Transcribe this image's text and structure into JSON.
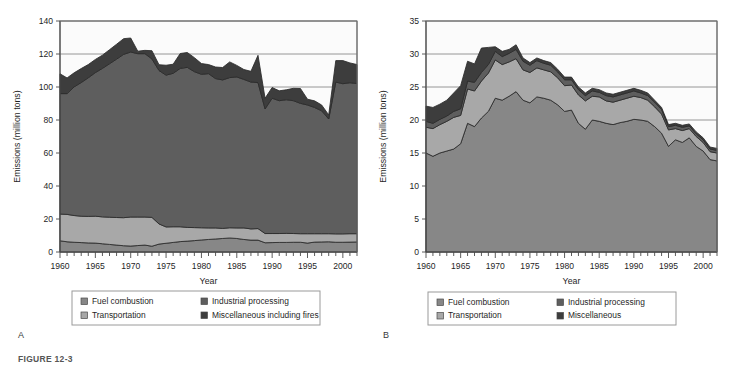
{
  "figure": {
    "caption": "FIGURE 12-3",
    "panel_a_letter": "A",
    "panel_b_letter": "B"
  },
  "colors": {
    "fuel_combustion": "#878787",
    "industrial_processing": "#5e5e5e",
    "transportation": "#a8a8a8",
    "miscellaneous": "#3d3d3d",
    "plot_background": "#fbfbfb",
    "gridline": "#8a8a8a",
    "axis": "#4a4a4a",
    "outline": "#2a2a2a"
  },
  "panel_a": {
    "letter": "A",
    "legend": {
      "items": [
        {
          "label": "Fuel combustion",
          "color_key": "fuel_combustion"
        },
        {
          "label": "Industrial processing",
          "color_key": "industrial_processing"
        },
        {
          "label": "Transportation",
          "color_key": "transportation"
        },
        {
          "label": "Miscellaneous including fires",
          "color_key": "miscellaneous"
        }
      ]
    },
    "chart_data": {
      "type": "area",
      "stacked": true,
      "title": "",
      "xlabel": "Year",
      "ylabel": "Emissions (million tons)",
      "xlim": [
        1960,
        2002
      ],
      "ylim": [
        0,
        140
      ],
      "yticks": [
        0,
        20,
        40,
        60,
        80,
        100,
        120,
        140
      ],
      "xticks": [
        1960,
        1965,
        1970,
        1975,
        1980,
        1985,
        1990,
        1995,
        2000
      ],
      "grid": "horizontal",
      "legend_position": "below",
      "x": [
        1960,
        1961,
        1962,
        1963,
        1964,
        1965,
        1966,
        1967,
        1968,
        1969,
        1970,
        1971,
        1972,
        1973,
        1974,
        1975,
        1976,
        1977,
        1978,
        1979,
        1980,
        1981,
        1982,
        1983,
        1984,
        1985,
        1986,
        1987,
        1988,
        1989,
        1990,
        1991,
        1992,
        1993,
        1994,
        1995,
        1996,
        1997,
        1998,
        1999,
        2000,
        2001,
        2002
      ],
      "series": [
        {
          "name": "Fuel combustion",
          "color_key": "fuel_combustion",
          "values": [
            6.8,
            6.2,
            5.9,
            5.7,
            5.5,
            5.4,
            5.0,
            4.6,
            4.2,
            3.8,
            3.6,
            3.9,
            4.2,
            3.5,
            4.8,
            5.3,
            5.8,
            6.3,
            6.6,
            6.9,
            7.3,
            7.6,
            7.9,
            8.2,
            8.5,
            8.2,
            7.6,
            7.2,
            7.2,
            5.6,
            5.7,
            5.8,
            5.8,
            5.9,
            5.9,
            5.4,
            6.0,
            6.1,
            6.2,
            5.9,
            5.9,
            6.0,
            6.1
          ]
        },
        {
          "name": "Transportation",
          "color_key": "transportation",
          "values": [
            16.2,
            16.6,
            16.2,
            16.0,
            16.1,
            16.3,
            16.3,
            16.5,
            16.7,
            17.0,
            17.6,
            17.3,
            17.0,
            17.5,
            12.2,
            9.9,
            9.5,
            9.0,
            8.3,
            7.9,
            7.4,
            7.0,
            6.7,
            6.1,
            6.2,
            6.4,
            7.0,
            6.8,
            7.0,
            5.6,
            5.5,
            5.4,
            5.5,
            5.3,
            5.2,
            5.7,
            5.1,
            5.0,
            4.9,
            5.1,
            5.1,
            5.1,
            5.0
          ]
        },
        {
          "name": "Industrial processing",
          "color_key": "industrial_processing",
          "values": [
            73.0,
            73.2,
            78.0,
            81.0,
            84.0,
            87.0,
            90.0,
            93.0,
            96.0,
            99.0,
            100.0,
            99.0,
            99.0,
            96.0,
            93.0,
            92.0,
            93.0,
            96.0,
            97.0,
            94.5,
            93.0,
            93.5,
            90.5,
            90.0,
            91.0,
            91.5,
            90.0,
            89.0,
            88.5,
            75.5,
            82.0,
            80.5,
            81.0,
            80.5,
            79.0,
            78.0,
            76.5,
            74.5,
            69.5,
            92.0,
            91.0,
            91.5,
            91.0
          ]
        },
        {
          "name": "Miscellaneous including fires",
          "color_key": "miscellaneous",
          "values": [
            12.0,
            9.5,
            8.5,
            8.5,
            8.0,
            8.0,
            8.0,
            8.5,
            9.0,
            9.5,
            8.5,
            1.5,
            2.0,
            5.0,
            3.5,
            6.0,
            5.5,
            9.0,
            9.0,
            8.5,
            6.5,
            5.5,
            7.0,
            7.5,
            9.5,
            7.0,
            6.0,
            6.5,
            16.5,
            6.5,
            6.5,
            6.0,
            6.0,
            7.5,
            9.0,
            3.5,
            4.0,
            3.5,
            2.5,
            13.0,
            14.0,
            12.0,
            11.5
          ]
        }
      ]
    }
  },
  "panel_b": {
    "letter": "B",
    "legend": {
      "items": [
        {
          "label": "Fuel combustion",
          "color_key": "fuel_combustion"
        },
        {
          "label": "Industrial processing",
          "color_key": "industrial_processing"
        },
        {
          "label": "Transportation",
          "color_key": "transportation"
        },
        {
          "label": "Miscellaneous",
          "color_key": "miscellaneous"
        }
      ]
    },
    "chart_data": {
      "type": "area",
      "stacked": true,
      "title": "",
      "xlabel": "Year",
      "ylabel": "Emissions (million tons)",
      "xlim": [
        1960,
        2002
      ],
      "ylim": [
        0,
        35
      ],
      "yticks": [
        0,
        5,
        10,
        15,
        20,
        25,
        30,
        35
      ],
      "xticks": [
        1960,
        1965,
        1970,
        1975,
        1980,
        1985,
        1990,
        1995,
        2000
      ],
      "grid": "horizontal",
      "legend_position": "below",
      "x": [
        1960,
        1961,
        1962,
        1963,
        1964,
        1965,
        1966,
        1967,
        1968,
        1969,
        1970,
        1971,
        1972,
        1973,
        1974,
        1975,
        1976,
        1977,
        1978,
        1979,
        1980,
        1981,
        1982,
        1983,
        1984,
        1985,
        1986,
        1987,
        1988,
        1989,
        1990,
        1991,
        1992,
        1993,
        1994,
        1995,
        1996,
        1997,
        1998,
        1999,
        2000,
        2001,
        2002
      ],
      "series": [
        {
          "name": "Fuel combustion",
          "color_key": "fuel_combustion",
          "values": [
            15.0,
            14.5,
            15.0,
            15.3,
            15.6,
            16.4,
            19.5,
            19.0,
            20.3,
            21.3,
            23.3,
            23.0,
            23.6,
            24.3,
            23.0,
            22.6,
            23.5,
            23.3,
            23.0,
            22.3,
            21.3,
            21.5,
            19.5,
            18.6,
            20.0,
            19.8,
            19.5,
            19.3,
            19.6,
            19.8,
            20.1,
            20.0,
            19.8,
            19.0,
            18.0,
            16.0,
            17.0,
            16.6,
            17.3,
            16.0,
            15.3,
            14.0,
            13.8
          ]
        },
        {
          "name": "Transportation",
          "color_key": "transportation",
          "values": [
            3.9,
            4.2,
            4.3,
            4.5,
            4.8,
            4.3,
            5.2,
            5.4,
            5.6,
            5.8,
            5.8,
            5.4,
            5.2,
            5.0,
            4.6,
            4.6,
            4.4,
            4.3,
            4.3,
            4.1,
            3.9,
            3.8,
            4.3,
            4.3,
            3.6,
            3.7,
            3.4,
            3.4,
            3.4,
            3.5,
            3.5,
            3.4,
            3.2,
            3.0,
            2.9,
            2.5,
            1.7,
            1.8,
            1.4,
            1.5,
            1.3,
            1.2,
            1.2
          ]
        },
        {
          "name": "Industrial processing",
          "color_key": "industrial_processing",
          "values": [
            0.9,
            0.8,
            0.8,
            0.8,
            0.9,
            1.0,
            1.2,
            1.3,
            1.3,
            1.3,
            1.3,
            1.2,
            1.3,
            1.4,
            1.3,
            1.1,
            1.1,
            1.0,
            1.0,
            0.9,
            0.9,
            0.8,
            0.8,
            0.8,
            0.8,
            0.7,
            0.8,
            0.8,
            0.8,
            0.8,
            0.8,
            0.7,
            0.7,
            0.7,
            0.7,
            0.5,
            0.5,
            0.5,
            0.4,
            0.4,
            0.4,
            0.4,
            0.4
          ]
        },
        {
          "name": "Miscellaneous",
          "color_key": "miscellaneous",
          "values": [
            2.3,
            2.4,
            2.3,
            2.4,
            2.8,
            3.5,
            3.0,
            2.8,
            3.7,
            2.6,
            0.7,
            0.8,
            0.6,
            0.7,
            0.5,
            0.4,
            0.4,
            0.4,
            0.4,
            0.4,
            0.4,
            0.4,
            0.4,
            0.4,
            0.4,
            0.4,
            0.4,
            0.4,
            0.4,
            0.4,
            0.4,
            0.4,
            0.4,
            0.3,
            0.3,
            0.3,
            0.3,
            0.3,
            0.3,
            0.3,
            0.3,
            0.3,
            0.3
          ]
        }
      ]
    }
  }
}
